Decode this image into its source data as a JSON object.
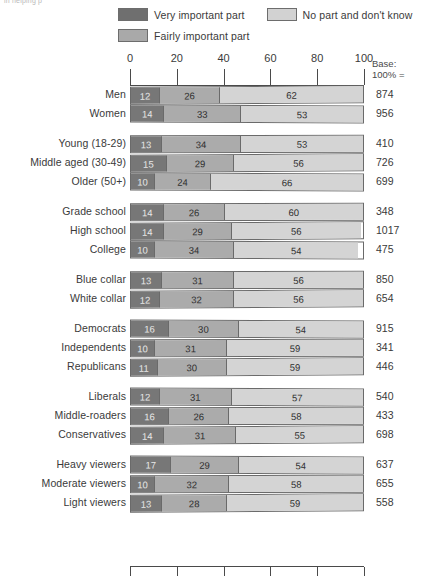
{
  "top_caption": "in helping p",
  "legend": {
    "items": [
      {
        "label": "Very important part",
        "color": "#777777",
        "key": "very"
      },
      {
        "label": "No part and don't know",
        "color": "#d4d4d4",
        "key": "nopart"
      },
      {
        "label": "Fairly important part",
        "color": "#ababab",
        "key": "fairly"
      }
    ]
  },
  "base_header": {
    "line1": "Base:",
    "line2": "100% ="
  },
  "chart_data": {
    "type": "bar",
    "title": "",
    "subtitle": "",
    "xlabel": "",
    "ylabel": "",
    "orientation": "horizontal",
    "stacked": true,
    "normalized_percent": true,
    "xlim": [
      0,
      100
    ],
    "xticks": [
      0,
      20,
      40,
      60,
      80,
      100
    ],
    "xtick_labels": [
      "0",
      "20",
      "40",
      "60",
      "80",
      "100"
    ],
    "grid": false,
    "legend_position": "top",
    "series": [
      {
        "name": "Very important part",
        "color": "#777777",
        "values": [
          12,
          14,
          13,
          15,
          10,
          14,
          14,
          10,
          13,
          12,
          16,
          10,
          11,
          12,
          16,
          14,
          17,
          10,
          13
        ]
      },
      {
        "name": "Fairly important part",
        "color": "#ababab",
        "values": [
          26,
          33,
          34,
          29,
          24,
          26,
          29,
          34,
          31,
          32,
          30,
          31,
          30,
          31,
          26,
          31,
          29,
          32,
          28
        ]
      },
      {
        "name": "No part and don't know",
        "color": "#d4d4d4",
        "values": [
          62,
          53,
          53,
          56,
          66,
          60,
          56,
          54,
          56,
          56,
          54,
          59,
          59,
          57,
          58,
          55,
          54,
          58,
          59
        ]
      }
    ],
    "categories": [
      "Men",
      "Women",
      "Young (18-29)",
      "Middle aged (30-49)",
      "Older (50+)",
      "Grade school",
      "High school",
      "College",
      "Blue collar",
      "White collar",
      "Democrats",
      "Independents",
      "Republicans",
      "Liberals",
      "Middle-roaders",
      "Conservatives",
      "Heavy viewers",
      "Moderate viewers",
      "Light viewers"
    ],
    "base_counts": [
      874,
      956,
      410,
      726,
      699,
      348,
      1017,
      475,
      850,
      654,
      915,
      341,
      446,
      540,
      433,
      698,
      637,
      655,
      558
    ],
    "groups": [
      {
        "name": "Sex",
        "rows": [
          {
            "label": "Men",
            "very": 12,
            "fairly": 26,
            "nopart": 62,
            "base": 874
          },
          {
            "label": "Women",
            "very": 14,
            "fairly": 33,
            "nopart": 53,
            "base": 956
          }
        ]
      },
      {
        "name": "Age",
        "rows": [
          {
            "label": "Young (18-29)",
            "very": 13,
            "fairly": 34,
            "nopart": 53,
            "base": 410
          },
          {
            "label": "Middle aged (30-49)",
            "very": 15,
            "fairly": 29,
            "nopart": 56,
            "base": 726
          },
          {
            "label": "Older (50+)",
            "very": 10,
            "fairly": 24,
            "nopart": 66,
            "base": 699
          }
        ]
      },
      {
        "name": "Education",
        "rows": [
          {
            "label": "Grade school",
            "very": 14,
            "fairly": 26,
            "nopart": 60,
            "base": 348
          },
          {
            "label": "High school",
            "very": 14,
            "fairly": 29,
            "nopart": 56,
            "base": 1017
          },
          {
            "label": "College",
            "very": 10,
            "fairly": 34,
            "nopart": 54,
            "base": 475
          }
        ]
      },
      {
        "name": "Occupation",
        "rows": [
          {
            "label": "Blue collar",
            "very": 13,
            "fairly": 31,
            "nopart": 56,
            "base": 850
          },
          {
            "label": "White collar",
            "very": 12,
            "fairly": 32,
            "nopart": 56,
            "base": 654
          }
        ]
      },
      {
        "name": "Party",
        "rows": [
          {
            "label": "Democrats",
            "very": 16,
            "fairly": 30,
            "nopart": 54,
            "base": 915
          },
          {
            "label": "Independents",
            "very": 10,
            "fairly": 31,
            "nopart": 59,
            "base": 341
          },
          {
            "label": "Republicans",
            "very": 11,
            "fairly": 30,
            "nopart": 59,
            "base": 446
          }
        ]
      },
      {
        "name": "Ideology",
        "rows": [
          {
            "label": "Liberals",
            "very": 12,
            "fairly": 31,
            "nopart": 57,
            "base": 540
          },
          {
            "label": "Middle-roaders",
            "very": 16,
            "fairly": 26,
            "nopart": 58,
            "base": 433
          },
          {
            "label": "Conservatives",
            "very": 14,
            "fairly": 31,
            "nopart": 55,
            "base": 698
          }
        ]
      },
      {
        "name": "Viewing",
        "rows": [
          {
            "label": "Heavy viewers",
            "very": 17,
            "fairly": 29,
            "nopart": 54,
            "base": 637
          },
          {
            "label": "Moderate viewers",
            "very": 10,
            "fairly": 32,
            "nopart": 58,
            "base": 655
          },
          {
            "label": "Light viewers",
            "very": 13,
            "fairly": 28,
            "nopart": 59,
            "base": 558
          }
        ]
      }
    ]
  }
}
